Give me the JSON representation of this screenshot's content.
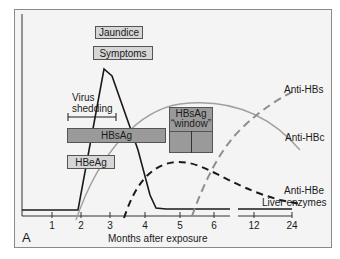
{
  "figure": {
    "panel_label": "A",
    "xlabel": "Months after exposure",
    "x_ticks": [
      "1",
      "2",
      "3",
      "4",
      "5",
      "6",
      "12",
      "24"
    ]
  },
  "boxes": {
    "jaundice": "Jaundice",
    "symptoms": "Symptoms",
    "hbsag": "HBsAg",
    "hbeag": "HBeAg",
    "window_line1": "HBsAg",
    "window_line2": "“window”"
  },
  "labels": {
    "virus_shedding_1": "Virus",
    "virus_shedding_2": "shedding",
    "anti_hbs": "Anti-HBs",
    "anti_hbc": "Anti-HBc",
    "anti_hbe": "Anti-HBe",
    "liver_enzymes": "Liver enzymes"
  },
  "colors": {
    "frame_bg": "#f4f4f4",
    "hbsag_bar": "#9a9a9a",
    "light_box": "#d6d6d6",
    "gray_curve": "#a0a0a0",
    "dark_curve": "#1a1a1a"
  }
}
